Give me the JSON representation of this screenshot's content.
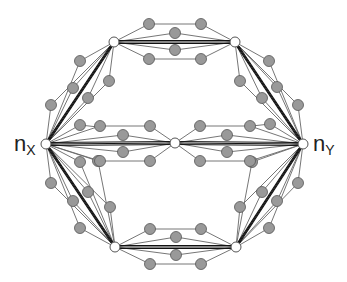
{
  "labels": {
    "left": {
      "base": "n",
      "sub": "X"
    },
    "right": {
      "base": "n",
      "sub": "Y"
    }
  },
  "colors": {
    "white_node_fill": "#ffffff",
    "gray_node_fill": "#999999",
    "node_stroke": "#555555",
    "thin_edge": "#666666",
    "thick_edge": "#111111"
  },
  "hub_nodes": [
    {
      "id": "nX",
      "x": 46,
      "y": 144
    },
    {
      "id": "nY",
      "x": 303,
      "y": 144
    },
    {
      "id": "c",
      "x": 175,
      "y": 143
    },
    {
      "id": "tl",
      "x": 114,
      "y": 42
    },
    {
      "id": "tr",
      "x": 235,
      "y": 42
    },
    {
      "id": "bl",
      "x": 115,
      "y": 247
    },
    {
      "id": "br",
      "x": 236,
      "y": 247
    }
  ],
  "thick_edges": [
    [
      "nX",
      "tl"
    ],
    [
      "nX",
      "bl"
    ],
    [
      "nX",
      "c"
    ],
    [
      "c",
      "nY"
    ],
    [
      "tr",
      "nY"
    ],
    [
      "br",
      "nY"
    ],
    [
      "tl",
      "tr"
    ],
    [
      "bl",
      "br"
    ]
  ],
  "paths": [
    [
      [
        114,
        42
      ],
      [
        149,
        24
      ],
      [
        201,
        24
      ],
      [
        235,
        42
      ]
    ],
    [
      [
        114,
        42
      ],
      [
        175,
        33
      ],
      [
        235,
        42
      ]
    ],
    [
      [
        114,
        42
      ],
      [
        175,
        50
      ],
      [
        235,
        42
      ]
    ],
    [
      [
        114,
        42
      ],
      [
        149,
        59
      ],
      [
        201,
        59
      ],
      [
        235,
        42
      ]
    ],
    [
      [
        115,
        247
      ],
      [
        150,
        229
      ],
      [
        201,
        229
      ],
      [
        236,
        247
      ]
    ],
    [
      [
        115,
        247
      ],
      [
        176,
        237
      ],
      [
        236,
        247
      ]
    ],
    [
      [
        115,
        247
      ],
      [
        176,
        255
      ],
      [
        236,
        247
      ]
    ],
    [
      [
        115,
        247
      ],
      [
        150,
        264
      ],
      [
        201,
        264
      ],
      [
        236,
        247
      ]
    ],
    [
      [
        46,
        144
      ],
      [
        80,
        61
      ],
      [
        114,
        42
      ]
    ],
    [
      [
        46,
        144
      ],
      [
        73,
        88
      ],
      [
        114,
        42
      ]
    ],
    [
      [
        46,
        144
      ],
      [
        51,
        105
      ],
      [
        114,
        42
      ]
    ],
    [
      [
        46,
        144
      ],
      [
        88,
        98
      ],
      [
        114,
        42
      ]
    ],
    [
      [
        46,
        144
      ],
      [
        109,
        81
      ],
      [
        114,
        42
      ]
    ],
    [
      [
        46,
        144
      ],
      [
        80,
        162
      ],
      [
        115,
        247
      ]
    ],
    [
      [
        46,
        144
      ],
      [
        98,
        161
      ],
      [
        115,
        247
      ]
    ],
    [
      [
        46,
        144
      ],
      [
        51,
        183
      ],
      [
        115,
        247
      ]
    ],
    [
      [
        46,
        144
      ],
      [
        88,
        192
      ],
      [
        115,
        247
      ]
    ],
    [
      [
        46,
        144
      ],
      [
        73,
        201
      ],
      [
        115,
        247
      ]
    ],
    [
      [
        46,
        144
      ],
      [
        110,
        207
      ],
      [
        115,
        247
      ]
    ],
    [
      [
        46,
        144
      ],
      [
        80,
        228
      ],
      [
        115,
        247
      ]
    ],
    [
      [
        303,
        144
      ],
      [
        269,
        61
      ],
      [
        235,
        42
      ]
    ],
    [
      [
        303,
        144
      ],
      [
        277,
        87
      ],
      [
        235,
        42
      ]
    ],
    [
      [
        303,
        144
      ],
      [
        262,
        98
      ],
      [
        235,
        42
      ]
    ],
    [
      [
        303,
        144
      ],
      [
        298,
        105
      ],
      [
        235,
        42
      ]
    ],
    [
      [
        303,
        144
      ],
      [
        240,
        81
      ],
      [
        235,
        42
      ]
    ],
    [
      [
        303,
        144
      ],
      [
        269,
        228
      ],
      [
        236,
        247
      ]
    ],
    [
      [
        303,
        144
      ],
      [
        277,
        201
      ],
      [
        236,
        247
      ]
    ],
    [
      [
        303,
        144
      ],
      [
        262,
        192
      ],
      [
        236,
        247
      ]
    ],
    [
      [
        303,
        144
      ],
      [
        298,
        183
      ],
      [
        236,
        247
      ]
    ],
    [
      [
        303,
        144
      ],
      [
        240,
        207
      ],
      [
        236,
        247
      ]
    ],
    [
      [
        303,
        144
      ],
      [
        252,
        162
      ],
      [
        236,
        247
      ]
    ],
    [
      [
        46,
        144
      ],
      [
        100,
        126
      ],
      [
        150,
        126
      ],
      [
        175,
        143
      ]
    ],
    [
      [
        46,
        144
      ],
      [
        123,
        135
      ],
      [
        175,
        143
      ]
    ],
    [
      [
        46,
        144
      ],
      [
        123,
        152
      ],
      [
        175,
        143
      ]
    ],
    [
      [
        46,
        144
      ],
      [
        100,
        161
      ],
      [
        150,
        161
      ],
      [
        175,
        143
      ]
    ],
    [
      [
        175,
        143
      ],
      [
        200,
        126
      ],
      [
        250,
        126
      ],
      [
        303,
        144
      ]
    ],
    [
      [
        175,
        143
      ],
      [
        227,
        135
      ],
      [
        303,
        144
      ]
    ],
    [
      [
        175,
        143
      ],
      [
        227,
        152
      ],
      [
        303,
        144
      ]
    ],
    [
      [
        175,
        143
      ],
      [
        200,
        161
      ],
      [
        250,
        161
      ],
      [
        303,
        144
      ]
    ],
    [
      [
        46,
        144
      ],
      [
        80,
        125
      ],
      [
        98,
        127
      ]
    ],
    [
      [
        303,
        144
      ],
      [
        270,
        124
      ],
      [
        252,
        126
      ]
    ]
  ]
}
